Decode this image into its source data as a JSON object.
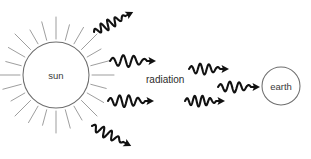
{
  "diagram": {
    "background_color": "#ffffff",
    "width": 311,
    "height": 159,
    "bodies": [
      {
        "id": "sun",
        "label": "sun",
        "cx": 56,
        "cy": 75,
        "r": 33,
        "label_x": 56,
        "label_y": 78.5,
        "outline_color": "#6e6e6e",
        "text_color": "#3a3a3a",
        "has_rays": true,
        "ray_count": 24,
        "ray_inner_radius": 36,
        "ray_outer_radius": 52,
        "ray_color": "#8d8d8d"
      },
      {
        "id": "earth",
        "label": "earth",
        "cx": 281,
        "cy": 86,
        "r": 19,
        "label_x": 281,
        "label_y": 89.5,
        "outline_color": "#6e6e6e",
        "text_color": "#3a3a3a",
        "has_rays": false
      }
    ],
    "center_label": {
      "id": "radiation",
      "text": "radiation",
      "x": 146,
      "y": 83,
      "color": "#2b2b2b"
    },
    "waves": [
      {
        "id": "wave-up-left",
        "description": "radiation ray travelling up and to the right, away from the sun",
        "start_x": 94,
        "start_y": 32,
        "angle_deg": -27,
        "length": 44,
        "amplitude": 5.0,
        "cycles": 4.5,
        "color": "#111111"
      },
      {
        "id": "wave-mid-upper",
        "description": "horizontal radiation ray above the radiation label",
        "start_x": 110,
        "start_y": 61,
        "angle_deg": 0,
        "length": 46,
        "amplitude": 6.0,
        "cycles": 3.5,
        "color": "#111111"
      },
      {
        "id": "wave-mid-lower",
        "description": "horizontal radiation ray below the radiation label",
        "start_x": 108,
        "start_y": 101,
        "angle_deg": 0,
        "length": 46,
        "amplitude": 6.0,
        "cycles": 4.0,
        "color": "#111111"
      },
      {
        "id": "wave-down-left",
        "description": "radiation ray travelling down and to the right, away from the sun",
        "start_x": 92,
        "start_y": 126,
        "angle_deg": 27,
        "length": 44,
        "amplitude": 5.0,
        "cycles": 4.0,
        "color": "#111111"
      },
      {
        "id": "wave-right-upper",
        "description": "radiation ray approaching the earth from upper left",
        "start_x": 189,
        "start_y": 69,
        "angle_deg": 0,
        "length": 40,
        "amplitude": 5.5,
        "cycles": 3.5,
        "color": "#111111"
      },
      {
        "id": "wave-right-center",
        "description": "radiation ray pointing directly into the earth",
        "start_x": 218,
        "start_y": 87,
        "angle_deg": 0,
        "length": 42,
        "amplitude": 5.5,
        "cycles": 3.5,
        "color": "#111111"
      },
      {
        "id": "wave-right-lower",
        "description": "radiation ray approaching the earth from lower left",
        "start_x": 185,
        "start_y": 101,
        "angle_deg": 0,
        "length": 40,
        "amplitude": 5.5,
        "cycles": 4.0,
        "color": "#111111"
      }
    ]
  }
}
